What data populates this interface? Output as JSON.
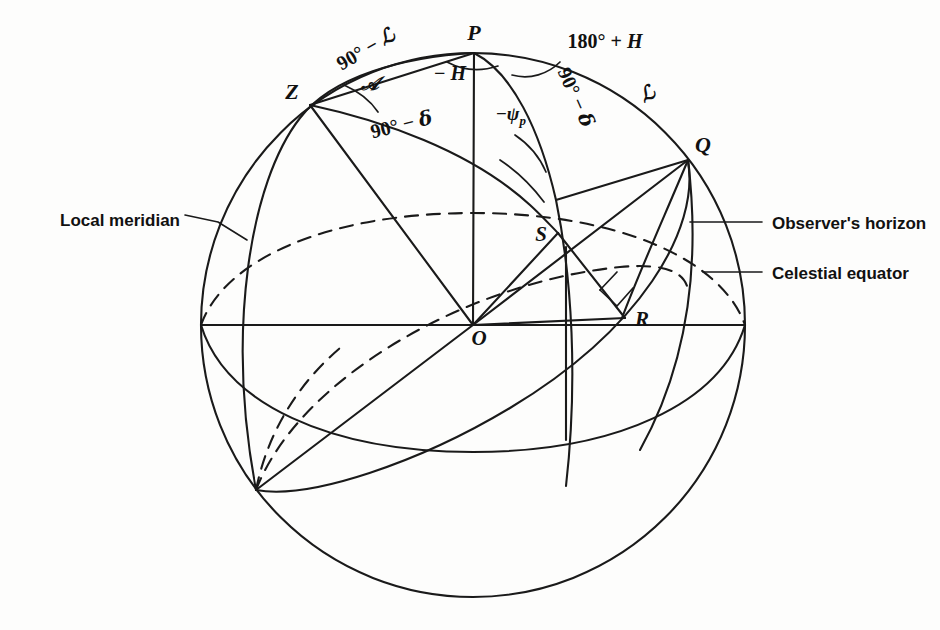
{
  "figure": {
    "kind": "celestial-sphere-diagram",
    "background": "#fdfdfc",
    "ink": "#1a1a1a"
  },
  "geometry": {
    "sphere": {
      "cx": 473,
      "cy": 325,
      "r": 272
    },
    "points": {
      "P": {
        "x": 474,
        "y": 53
      },
      "Z": {
        "x": 310,
        "y": 105
      },
      "Q": {
        "x": 688,
        "y": 160
      },
      "S": {
        "x": 558,
        "y": 233
      },
      "R": {
        "x": 625,
        "y": 318
      },
      "O": {
        "x": 473,
        "y": 325
      }
    }
  },
  "vertex_labels": [
    {
      "name": "point-P",
      "text": "P",
      "x": 474,
      "y": 40,
      "anchor": "middle"
    },
    {
      "name": "point-Z",
      "text": "Z",
      "x": 292,
      "y": 99,
      "anchor": "middle"
    },
    {
      "name": "point-Q",
      "text": "Q",
      "x": 703,
      "y": 152,
      "anchor": "middle"
    },
    {
      "name": "point-S",
      "text": "S",
      "x": 541,
      "y": 241,
      "anchor": "middle"
    },
    {
      "name": "point-R",
      "text": "R",
      "x": 642,
      "y": 326,
      "anchor": "middle"
    },
    {
      "name": "point-O",
      "text": "O",
      "x": 479,
      "y": 345,
      "anchor": "middle"
    }
  ],
  "arc_labels": [
    {
      "name": "label-colatitude",
      "x": 369,
      "y": 55,
      "rotate": -30,
      "parts": [
        {
          "t": "90",
          "style": "up"
        },
        {
          "t": "°",
          "style": "up"
        },
        {
          "t": " − ",
          "style": "up"
        },
        {
          "t": "ℒ",
          "style": "script"
        }
      ]
    },
    {
      "name": "label-polar-distance",
      "x": 403,
      "y": 131,
      "rotate": -14,
      "parts": [
        {
          "t": "90",
          "style": "up"
        },
        {
          "t": "°",
          "style": "up"
        },
        {
          "t": " − ",
          "style": "up"
        },
        {
          "t": "δ",
          "style": "script"
        }
      ]
    },
    {
      "name": "label-azimuth",
      "x": 370,
      "y": 90,
      "rotate": 0,
      "parts": [
        {
          "t": "𝒜",
          "style": "script"
        }
      ]
    },
    {
      "name": "label-hour-angle",
      "x": 450,
      "y": 80,
      "rotate": 0,
      "parts": [
        {
          "t": "− ",
          "style": "up"
        },
        {
          "t": "H",
          "style": "ital"
        }
      ]
    },
    {
      "name": "label-hour-angle-supplement",
      "x": 605,
      "y": 48,
      "rotate": 0,
      "parts": [
        {
          "t": "180",
          "style": "up"
        },
        {
          "t": "°",
          "style": "up"
        },
        {
          "t": " + ",
          "style": "up"
        },
        {
          "t": "H",
          "style": "ital"
        }
      ]
    },
    {
      "name": "label-parallactic-angle",
      "x": 511,
      "y": 120,
      "rotate": 0,
      "parts": [
        {
          "t": "−",
          "style": "up"
        },
        {
          "t": "ψ",
          "style": "ital"
        },
        {
          "t": "p",
          "style": "sub"
        }
      ]
    },
    {
      "name": "label-codeclination",
      "x": 570,
      "y": 100,
      "rotate": 66,
      "parts": [
        {
          "t": "90",
          "style": "up"
        },
        {
          "t": "°",
          "style": "up"
        },
        {
          "t": " − ",
          "style": "up"
        },
        {
          "t": "δ",
          "style": "script"
        }
      ]
    },
    {
      "name": "label-longitude",
      "x": 650,
      "y": 100,
      "rotate": -28,
      "parts": [
        {
          "t": "ℒ",
          "style": "script"
        }
      ]
    }
  ],
  "callouts": [
    {
      "name": "callout-local-meridian",
      "text": "Local meridian",
      "text_x": 60,
      "text_y": 219,
      "anchor": "start",
      "leader": "M 185 215 L 218 222 L 247 240"
    },
    {
      "name": "callout-observers-horizon",
      "text": "Observer's horizon",
      "text_x": 772,
      "text_y": 227,
      "anchor": "start",
      "leader": "M 762 222 L 690 222"
    },
    {
      "name": "callout-celestial-equator",
      "text": "Celestial equator",
      "text_x": 772,
      "text_y": 277,
      "anchor": "start",
      "leader": "M 762 272 L 703 272"
    }
  ]
}
